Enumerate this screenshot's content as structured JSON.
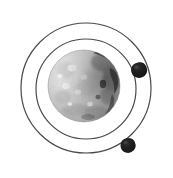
{
  "figure": {
    "title": "Planet with two orbiting moons",
    "description": "Pencil-style illustration of a textured grey planet sphere encircled by two thin concentric orbit rings, with a small dark irregular moon on each ring.",
    "canvas": {
      "width": 173,
      "height": 178,
      "background_color": "#ffffff"
    }
  },
  "colors": {
    "background": "#ffffff",
    "orbit_stroke": "#3a3a3a",
    "planet_light": "#e9e9e9",
    "planet_mid": "#c9c9c9",
    "planet_shadow": "#8f8f8f",
    "planet_dark_patch": "#3d3d3d",
    "moon_fill": "#1c1c1c",
    "highlight": "#fdfdfd"
  },
  "orbits": [
    {
      "name": "outer-orbit",
      "center_x": 86,
      "center_y": 88,
      "radius": 65,
      "stroke_width": 1.2,
      "label": "Outer orbit"
    },
    {
      "name": "inner-orbit",
      "center_x": 86,
      "center_y": 89,
      "radius": 50,
      "stroke_width": 1.2,
      "label": "Inner orbit"
    }
  ],
  "planet": {
    "name": "central-planet",
    "label": "Planet",
    "center_x": 84,
    "center_y": 86,
    "radius": 36
  },
  "moons": [
    {
      "name": "moon-upper-right",
      "label": "Moon on inner orbit",
      "center_x": 139,
      "center_y": 70,
      "radius": 7.5,
      "orbit": "inner-orbit"
    },
    {
      "name": "moon-lower-right",
      "label": "Moon on outer orbit",
      "center_x": 128,
      "center_y": 145,
      "radius": 7,
      "orbit": "outer-orbit"
    }
  ],
  "chart_data": {
    "type": "scatter",
    "title": "Planet with two orbiting moons",
    "xlabel": "",
    "ylabel": "",
    "xlim": [
      0,
      173
    ],
    "ylim": [
      0,
      178
    ],
    "grid": false,
    "legend": "none",
    "series": [
      {
        "name": "Orbit rings",
        "kind": "circle-outline",
        "values": [
          {
            "cx": 86,
            "cy": 88,
            "r": 65
          },
          {
            "cx": 86,
            "cy": 89,
            "r": 50
          }
        ]
      },
      {
        "name": "Planet",
        "kind": "filled-sphere",
        "values": [
          {
            "cx": 84,
            "cy": 86,
            "r": 36
          }
        ]
      },
      {
        "name": "Moons",
        "kind": "filled-blob",
        "values": [
          {
            "cx": 139,
            "cy": 70,
            "r": 7.5
          },
          {
            "cx": 128,
            "cy": 145,
            "r": 7
          }
        ]
      }
    ]
  }
}
